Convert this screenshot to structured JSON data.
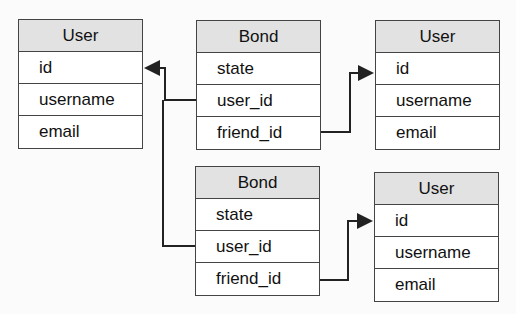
{
  "tables": [
    {
      "title": "User",
      "fields": [
        "id",
        "username",
        "email"
      ]
    },
    {
      "title": "Bond",
      "fields": [
        "state",
        "user_id",
        "friend_id"
      ]
    },
    {
      "title": "User",
      "fields": [
        "id",
        "username",
        "email"
      ]
    },
    {
      "title": "Bond",
      "fields": [
        "state",
        "user_id",
        "friend_id"
      ]
    },
    {
      "title": "User",
      "fields": [
        "id",
        "username",
        "email"
      ]
    }
  ],
  "links": [
    {
      "from": "Bond(top).user_id",
      "to": "User(left).id"
    },
    {
      "from": "Bond(top).friend_id",
      "to": "User(top-right).id"
    },
    {
      "from": "Bond(bottom).user_id",
      "to": "User(left).id"
    },
    {
      "from": "Bond(bottom).friend_id",
      "to": "User(bottom-right).id"
    }
  ]
}
